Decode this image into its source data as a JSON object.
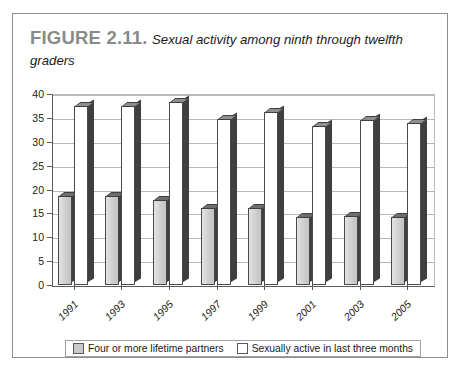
{
  "figure": {
    "label": "FIGURE 2.11.",
    "caption": "Sexual activity among ninth through twelfth graders"
  },
  "legend": {
    "items": [
      {
        "label": "Four or more lifetime partners",
        "swatch": "gray",
        "color": "#c9c9c9"
      },
      {
        "label": "Sexually active in last three months",
        "swatch": "white",
        "color": "#ffffff"
      }
    ]
  },
  "chart_data": {
    "type": "bar",
    "title": "Sexual activity among ninth through twelfth graders",
    "xlabel": "",
    "ylabel": "",
    "categories": [
      "1991",
      "1993",
      "1995",
      "1997",
      "1999",
      "2001",
      "2003",
      "2005"
    ],
    "series": [
      {
        "name": "Four or more lifetime partners",
        "color": "#c9c9c9",
        "values": [
          18.7,
          18.7,
          17.8,
          16.2,
          16.2,
          14.2,
          14.4,
          14.3
        ]
      },
      {
        "name": "Sexually active in last three months",
        "color": "#ffffff",
        "values": [
          37.5,
          37.5,
          38.3,
          34.8,
          36.3,
          33.4,
          34.6,
          33.9
        ]
      }
    ],
    "ylim": [
      0,
      40
    ],
    "yticks": [
      0,
      5,
      10,
      15,
      20,
      25,
      30,
      35,
      40
    ],
    "ytick_labels": [
      "0",
      "5",
      "10",
      "15",
      "20",
      "25",
      "30",
      "35",
      "40"
    ],
    "grid": true,
    "legend_position": "bottom"
  }
}
